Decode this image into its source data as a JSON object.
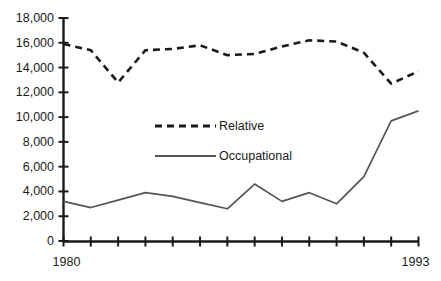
{
  "chart_data": {
    "type": "line",
    "title": "",
    "subtitle": "",
    "xlabel": "",
    "ylabel": "",
    "grid": false,
    "legend_position": "center",
    "x": [
      1980,
      1981,
      1982,
      1983,
      1984,
      1985,
      1986,
      1987,
      1988,
      1989,
      1990,
      1991,
      1992,
      1993
    ],
    "categories": [
      "1980",
      "1981",
      "1982",
      "1983",
      "1984",
      "1985",
      "1986",
      "1987",
      "1988",
      "1989",
      "1990",
      "1991",
      "1992",
      "1993"
    ],
    "xlim": [
      1980,
      1993
    ],
    "ylim": [
      0,
      18000
    ],
    "ytick_values": [
      0,
      2000,
      4000,
      6000,
      8000,
      10000,
      12000,
      14000,
      16000,
      18000
    ],
    "ytick_labels": [
      "0",
      "2,000",
      "4,000",
      "6,000",
      "8,000",
      "10,000",
      "12,000",
      "14,000",
      "16,000",
      "18,000"
    ],
    "xtick_labels_shown": [
      "1980",
      "1993"
    ],
    "xtick_first_label": "1980",
    "xtick_last_label": "1993",
    "series": [
      {
        "name": "Relative",
        "style": "dashed",
        "color": "#1a1a1a",
        "values": [
          15900,
          15400,
          12800,
          15400,
          15500,
          15800,
          15000,
          15100,
          15700,
          16200,
          16100,
          15200,
          12700,
          13700
        ]
      },
      {
        "name": "Occupational",
        "style": "solid",
        "color": "#555555",
        "values": [
          3200,
          2700,
          3300,
          3900,
          3600,
          3100,
          2600,
          4600,
          3200,
          3900,
          3000,
          5200,
          9700,
          10500
        ]
      }
    ]
  },
  "legend": {
    "entries": [
      {
        "label": "Relative",
        "style": "dashed"
      },
      {
        "label": "Occupational",
        "style": "solid"
      }
    ]
  },
  "colors": {
    "axis": "#1a1a1a",
    "relative_line": "#1a1a1a",
    "occupational_line": "#555555",
    "text": "#1a1a1a",
    "background": "#ffffff"
  }
}
